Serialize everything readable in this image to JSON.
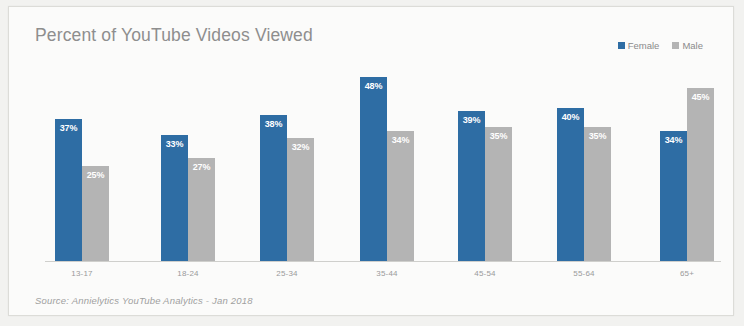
{
  "card": {
    "title": "Percent of YouTube Videos Viewed",
    "source": "Source: Annielytics YouTube Analytics - Jan 2018"
  },
  "legend": {
    "items": [
      {
        "label": "Female",
        "color": "#2e6da4"
      },
      {
        "label": "Male",
        "color": "#b4b4b4"
      }
    ]
  },
  "chart_data": {
    "type": "bar",
    "title": "Percent of YouTube Videos Viewed",
    "subtitle": "",
    "xlabel": "",
    "ylabel": "",
    "ylim": [
      0,
      50
    ],
    "grid": false,
    "legend_position": "top-right",
    "annotation": "Source: Annielytics YouTube Analytics - Jan 2018",
    "categories": [
      "13-17",
      "18-24",
      "25-34",
      "35-44",
      "45-54",
      "55-64",
      "65+"
    ],
    "series": [
      {
        "name": "Female",
        "color": "#2e6da4",
        "values": [
          37,
          33,
          38,
          48,
          39,
          40,
          34
        ],
        "labels": [
          "37%",
          "33%",
          "38%",
          "48%",
          "39%",
          "40%",
          "34%"
        ]
      },
      {
        "name": "Male",
        "color": "#b4b4b4",
        "values": [
          25,
          27,
          32,
          34,
          35,
          35,
          45
        ],
        "labels": [
          "25%",
          "27%",
          "32%",
          "34%",
          "35%",
          "35%",
          "45%"
        ]
      }
    ]
  }
}
